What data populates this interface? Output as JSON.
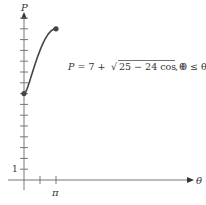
{
  "chart_data": {
    "type": "line",
    "title": "",
    "xlabel": "θ",
    "ylabel": "P",
    "annotation": "P = 7 + √(25 − 24 cos θ), 0 ≤ θ ≤ π",
    "x_ticks": [
      {
        "value": 1.5708,
        "label": ""
      },
      {
        "value": 3.1416,
        "label": "π"
      }
    ],
    "y_ticks": [
      1,
      2,
      3,
      4,
      5,
      6,
      7,
      8,
      9,
      10,
      11,
      12,
      13,
      14,
      15
    ],
    "y_tick_labels": [
      {
        "value": 1,
        "label": "1"
      }
    ],
    "series": [
      {
        "name": "P(θ)",
        "x": [
          0,
          0.3927,
          0.7854,
          1.1781,
          1.5708,
          1.9635,
          2.3562,
          2.7489,
          3.1416
        ],
        "values": [
          8,
          9.03,
          10.78,
          11.99,
          12.0,
          13.09,
          13.55,
          13.88,
          14
        ]
      }
    ],
    "endpoints": [
      {
        "x": 0,
        "y": 8
      },
      {
        "x": 3.1416,
        "y": 14
      }
    ],
    "xlim": [
      0,
      15.5
    ],
    "ylim": [
      0,
      15.5
    ],
    "grid": false
  },
  "labels": {
    "y_axis": "P",
    "x_axis": "θ",
    "x_tick_pi": "π",
    "y_tick_one": "1",
    "equation_lhs": "P = 7 + ",
    "equation_radicand": "25 − 24 cos θ",
    "equation_domain": ", 0 ≤ θ ≤ π"
  }
}
